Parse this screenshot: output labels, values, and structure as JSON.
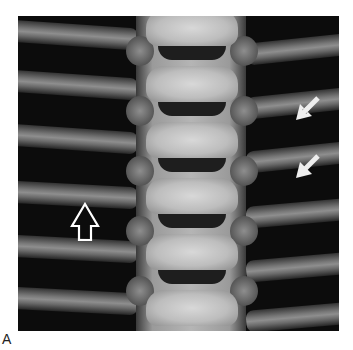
{
  "figure": {
    "panel_label": "A",
    "annotations": [
      {
        "type": "open-arrow",
        "direction": "up",
        "position": "left rib, mid"
      },
      {
        "type": "solid-arrow",
        "direction": "down-left",
        "position": "right rib, upper"
      },
      {
        "type": "solid-arrow",
        "direction": "down-left",
        "position": "right rib, middle"
      }
    ]
  }
}
